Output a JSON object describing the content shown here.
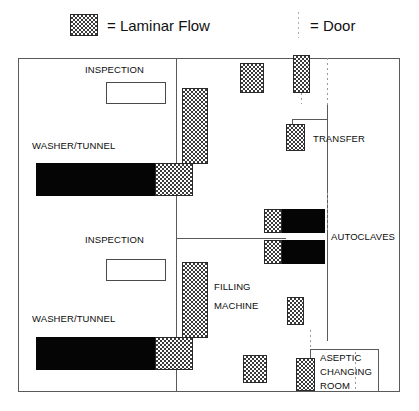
{
  "legend": {
    "laminar": {
      "symbol_name": "laminar-flow-swatch",
      "text": "= Laminar Flow"
    },
    "door": {
      "symbol_name": "door-dotted-line",
      "text": "= Door"
    }
  },
  "plan": {
    "title": "Aseptic Filling Suite Floor Plan",
    "labels": {
      "inspection_top": "INSPECTION",
      "inspection_bottom": "INSPECTION",
      "washer_tunnel_top": "WASHER/TUNNEL",
      "washer_tunnel_bottom": "WASHER/TUNNEL",
      "transfer": "TRANSFER",
      "autoclaves": "AUTOCLAVES",
      "filling_machine_line1": "FILLING",
      "filling_machine_line2": "MACHINE",
      "aseptic_line1": "ASEPTIC",
      "aseptic_line2": "CHANGING",
      "aseptic_line3": "ROOM"
    },
    "colors": {
      "laminar_fill": "#3a3a3a",
      "equipment_solid": "#050505",
      "wall": "#5a5a5a",
      "door": "#9a9a9a",
      "background": "#ffffff"
    },
    "equipment": {
      "washer_tunnel_top_solid": "washer-tunnel-top-body",
      "washer_tunnel_bottom_solid": "washer-tunnel-bottom-body",
      "autoclave_upper": "autoclave-upper",
      "autoclave_lower": "autoclave-lower"
    },
    "counts": {
      "washer_tunnels": 2,
      "inspection_stations": 2,
      "autoclaves": 2,
      "filling_machines": 1,
      "aseptic_changing_rooms": 1
    }
  }
}
